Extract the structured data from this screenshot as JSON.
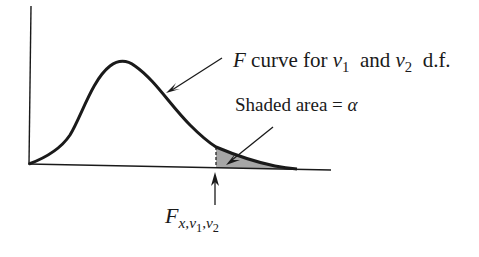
{
  "diagram": {
    "type": "F-distribution density with shaded right tail",
    "labels": {
      "curve": {
        "F": "F",
        "text1": " curve for ",
        "nu1_sym": "ν",
        "nu1_sub": "1",
        "text2": "  and ",
        "nu2_sym": "ν",
        "nu2_sub": "2",
        "text3": "  d.f."
      },
      "shaded": {
        "text": "Shaded area = ",
        "alpha": "α"
      },
      "critical_value": {
        "F": "F",
        "sub_x": "x,",
        "nu1_sym": "ν",
        "nu1_sub": "1",
        "comma": ",",
        "nu2_sym": "ν",
        "nu2_sub": "2"
      }
    },
    "colors": {
      "ink": "#1a1a1a",
      "shade": "#a6a6a6",
      "background": "#ffffff"
    }
  }
}
